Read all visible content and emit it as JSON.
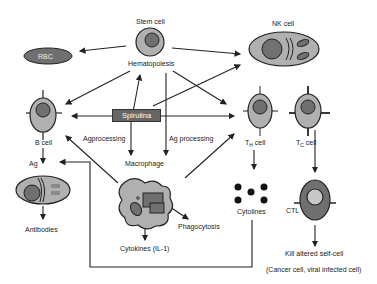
{
  "diagram": {
    "nodes": {
      "stem_cell": "Stem cell",
      "hematopoiesis": "Hematopoiesis",
      "nk_cell": "NK cell",
      "rbc": "RBC",
      "spirulina": "Spirulina",
      "b_cell": "B cell",
      "ag": "Ag",
      "antibodies": "Antibodies",
      "agprocessing": "Agprocessing",
      "ag_processing": "Ag processing",
      "macrophage": "Macrophage",
      "phagocytosis": "Phagocytosis",
      "cytokines": "Cytokines (IL-1)",
      "th_cell_main": "T",
      "th_cell_sub": "H",
      "th_cell_suffix": " cell",
      "tc_cell_main": "T",
      "tc_cell_sub": "C",
      "tc_cell_suffix": " cell",
      "cytolines": "Cytolines",
      "ctl": "CTL",
      "kill": "Kill altered self-cell",
      "kill_note": "(Cancer cell, viral infected cell)"
    },
    "colors": {
      "cell_fill": "#b0b0b0",
      "nucleus_fill": "#707070",
      "spirulina_fill": "#666666",
      "line": "#222222"
    }
  }
}
